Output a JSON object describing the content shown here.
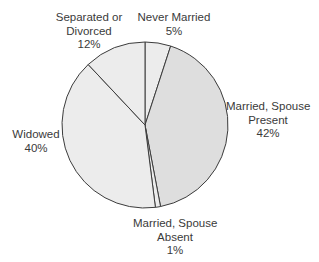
{
  "chart_data": {
    "type": "pie",
    "title": "",
    "start_angle_deg": 0,
    "direction": "clockwise",
    "slices": [
      {
        "label": "Never Married",
        "value": 5,
        "display": "5%",
        "color": "#ececec"
      },
      {
        "label": "Married, Spouse Present",
        "value": 42,
        "display": "42%",
        "color": "#dedede"
      },
      {
        "label": "Married, Spouse Absent",
        "value": 1,
        "display": "1%",
        "color": "#ececec"
      },
      {
        "label": "Widowed",
        "value": 40,
        "display": "40%",
        "color": "#ececec"
      },
      {
        "label": "Separated or Divorced",
        "value": 12,
        "display": "12%",
        "color": "#ececec"
      }
    ],
    "legend": "none (direct labels)",
    "stroke_color": "#3c3c3c"
  },
  "labels": {
    "never_married": {
      "line1": "Never Married",
      "pct": "5%"
    },
    "married_present": {
      "line1": "Married, Spouse",
      "line2": "Present",
      "pct": "42%"
    },
    "married_absent": {
      "line1": "Married, Spouse",
      "line2": "Absent",
      "pct": "1%"
    },
    "widowed": {
      "line1": "Widowed",
      "pct": "40%"
    },
    "separated": {
      "line1": "Separated or",
      "line2": "Divorced",
      "pct": "12%"
    }
  }
}
